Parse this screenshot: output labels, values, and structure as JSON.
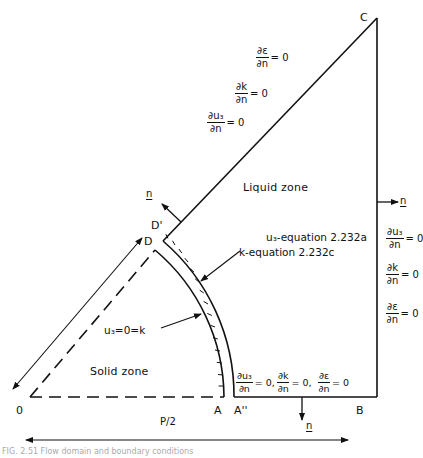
{
  "figure": {
    "points": {
      "O": "0",
      "A": "A",
      "A2": "A''",
      "B": "B",
      "C": "C",
      "D": "D",
      "D1": "D'"
    },
    "zones": {
      "liquid": "Liquid zone",
      "solid": "Solid zone"
    },
    "equations": {
      "u3_eq": "u₃-equation 2.232a",
      "k_eq": "k-equation 2.232c",
      "solid_cond": "u₃=0=k"
    },
    "normal_label": "n",
    "half_pitch": "P/2",
    "boundary_conditions": {
      "diagonal": [
        {
          "num": "∂ε",
          "den": "∂n",
          "rhs": "= 0"
        },
        {
          "num": "∂k",
          "den": "∂n",
          "rhs": "= 0"
        },
        {
          "num": "∂u₃",
          "den": "∂n",
          "rhs": "= 0"
        }
      ],
      "right": [
        {
          "num": "∂u₃",
          "den": "∂n",
          "rhs": "= 0"
        },
        {
          "num": "∂k",
          "den": "∂n",
          "rhs": "= 0"
        },
        {
          "num": "∂ε",
          "den": "∂n",
          "rhs": "= 0"
        }
      ],
      "bottom": [
        {
          "num": "∂u₃",
          "den": "∂n",
          "rhs": "= 0,"
        },
        {
          "num": "∂k",
          "den": "∂n",
          "rhs": "= 0,"
        },
        {
          "num": "∂ε",
          "den": "∂n",
          "rhs": "= 0"
        }
      ]
    },
    "caption": "FIG. 2.51  Flow domain and boundary conditions"
  }
}
